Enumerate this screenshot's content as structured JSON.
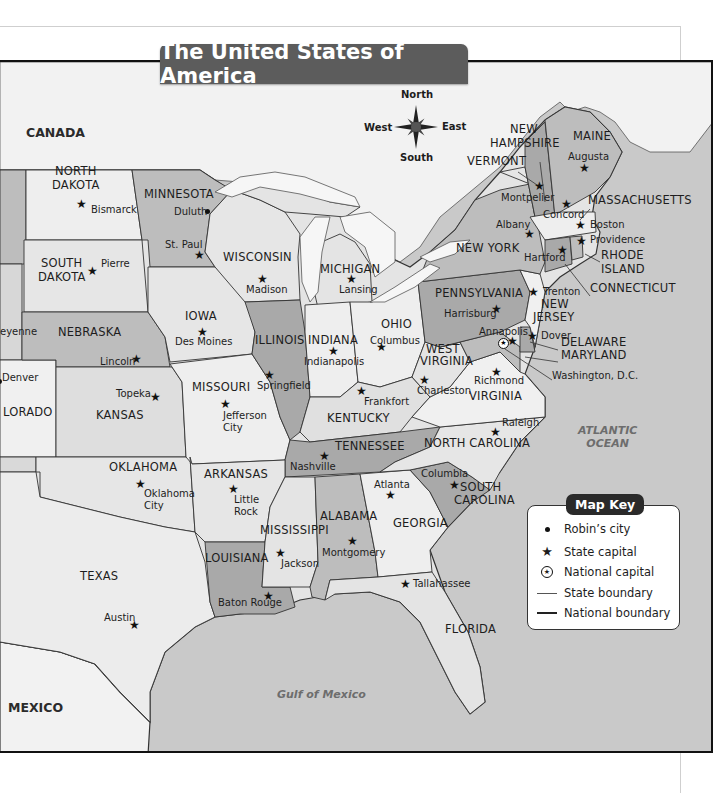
{
  "title": "The United States of America",
  "compass": {
    "north": "North",
    "south": "South",
    "east": "East",
    "west": "West"
  },
  "countries": [
    {
      "name": "CANADA",
      "x": 26,
      "y": 125
    },
    {
      "name": "MEXICO",
      "x": 8,
      "y": 700
    }
  ],
  "oceans": [
    {
      "name": "ATLANTIC\nOCEAN",
      "line1": "ATLANTIC",
      "line2": "OCEAN",
      "x": 578,
      "y": 423
    },
    {
      "name": "Gulf of Mexico",
      "line1": "Gulf of Mexico",
      "line2": "",
      "x": 277,
      "y": 687
    }
  ],
  "states": [
    {
      "name": "NORTH",
      "x": 55,
      "y": 172
    },
    {
      "name": "DAKOTA",
      "x": 52,
      "y": 186
    },
    {
      "name": "MINNESOTA",
      "x": 144,
      "y": 195
    },
    {
      "name": "SOUTH",
      "x": 41,
      "y": 264
    },
    {
      "name": "DAKOTA",
      "x": 38,
      "y": 278
    },
    {
      "name": "WISCONSIN",
      "x": 223,
      "y": 258
    },
    {
      "name": "MICHIGAN",
      "x": 320,
      "y": 270
    },
    {
      "name": "NEW YORK",
      "x": 456,
      "y": 249
    },
    {
      "name": "NEBRASKA",
      "x": 58,
      "y": 333
    },
    {
      "name": "IOWA",
      "x": 185,
      "y": 317
    },
    {
      "name": "ILLINOIS",
      "x": 255,
      "y": 341
    },
    {
      "name": "INDIANA",
      "x": 308,
      "y": 341
    },
    {
      "name": "OHIO",
      "x": 381,
      "y": 325
    },
    {
      "name": "PENNSYLVANIA",
      "x": 435,
      "y": 294
    },
    {
      "name": "NEW",
      "x": 541,
      "y": 305
    },
    {
      "name": "JERSEY",
      "x": 533,
      "y": 318
    },
    {
      "name": "WEST",
      "x": 426,
      "y": 350
    },
    {
      "name": "VIRGINIA",
      "x": 420,
      "y": 362
    },
    {
      "name": "VIRGINIA",
      "x": 469,
      "y": 397
    },
    {
      "name": "COLORADO",
      "display": "LORADO",
      "x": 3,
      "y": 413
    },
    {
      "name": "KANSAS",
      "x": 96,
      "y": 416
    },
    {
      "name": "MISSOURI",
      "x": 192,
      "y": 388
    },
    {
      "name": "KENTUCKY",
      "x": 327,
      "y": 419
    },
    {
      "name": "TENNESSEE",
      "x": 335,
      "y": 447
    },
    {
      "name": "NORTH CAROLINA",
      "x": 424,
      "y": 444
    },
    {
      "name": "OKLAHOMA",
      "x": 109,
      "y": 468
    },
    {
      "name": "ARKANSAS",
      "x": 204,
      "y": 475
    },
    {
      "name": "SOUTH",
      "x": 460,
      "y": 488
    },
    {
      "name": "CAROLINA",
      "x": 454,
      "y": 501
    },
    {
      "name": "GEORGIA",
      "x": 393,
      "y": 524
    },
    {
      "name": "ALABAMA",
      "x": 320,
      "y": 517
    },
    {
      "name": "MISSISSIPPI",
      "x": 260,
      "y": 531
    },
    {
      "name": "LOUISIANA",
      "x": 205,
      "y": 559
    },
    {
      "name": "TEXAS",
      "x": 80,
      "y": 577
    },
    {
      "name": "FLORIDA",
      "x": 445,
      "y": 630
    },
    {
      "name": "MAINE",
      "x": 573,
      "y": 137
    },
    {
      "name": "NEW",
      "x": 510,
      "y": 130
    },
    {
      "name": "HAMPSHIRE",
      "x": 490,
      "y": 144
    },
    {
      "name": "VERMONT",
      "x": 467,
      "y": 162
    },
    {
      "name": "MASSACHUSETTS",
      "x": 588,
      "y": 201
    },
    {
      "name": "RHODE",
      "x": 601,
      "y": 256
    },
    {
      "name": "ISLAND",
      "x": 601,
      "y": 270
    },
    {
      "name": "CONNECTICUT",
      "x": 590,
      "y": 289
    },
    {
      "name": "DELAWARE",
      "x": 561,
      "y": 343
    },
    {
      "name": "MARYLAND",
      "x": 561,
      "y": 356
    }
  ],
  "cities": [
    {
      "name": "Bismarck",
      "x": 91,
      "y": 210,
      "symbol": "star",
      "sx": 81,
      "sy": 204
    },
    {
      "name": "Duluth",
      "x": 174,
      "y": 212,
      "symbol": "dot",
      "sx": 207,
      "sy": 211
    },
    {
      "name": "St. Paul",
      "x": 165,
      "y": 245,
      "symbol": "star",
      "sx": 199,
      "sy": 255
    },
    {
      "name": "Pierre",
      "x": 101,
      "y": 264,
      "symbol": "star",
      "sx": 92,
      "sy": 271
    },
    {
      "name": "Madison",
      "x": 246,
      "y": 290,
      "symbol": "star",
      "sx": 262,
      "sy": 279
    },
    {
      "name": "Lansing",
      "x": 339,
      "y": 290,
      "symbol": "star",
      "sx": 351,
      "sy": 279
    },
    {
      "name": "Des Moines",
      "x": 175,
      "y": 342,
      "symbol": "star",
      "sx": 202,
      "sy": 332
    },
    {
      "name": "Lincoln",
      "x": 100,
      "y": 362,
      "symbol": "star",
      "sx": 136,
      "sy": 359
    },
    {
      "name": "Indianapolis",
      "x": 304,
      "y": 362,
      "symbol": "star",
      "sx": 333,
      "sy": 351
    },
    {
      "name": "Columbus",
      "x": 370,
      "y": 341,
      "symbol": "star",
      "sx": 381,
      "sy": 347
    },
    {
      "name": "Harrisburg",
      "x": 444,
      "y": 314,
      "symbol": "star",
      "sx": 496,
      "sy": 309
    },
    {
      "name": "Trenton",
      "x": 543,
      "y": 292,
      "symbol": "star",
      "sx": 533,
      "sy": 292
    },
    {
      "name": "Annapolis",
      "x": 479,
      "y": 332,
      "symbol": "star",
      "sx": 512,
      "sy": 341
    },
    {
      "name": "Dover",
      "x": 541,
      "y": 336,
      "symbol": "star",
      "sx": 532,
      "sy": 336
    },
    {
      "name": "Washington, D.C.",
      "x": 552,
      "y": 376,
      "symbol": "national-capital",
      "sx": 504,
      "sy": 344
    },
    {
      "name": "Charleston",
      "x": 417,
      "y": 391,
      "symbol": "star",
      "sx": 424,
      "sy": 380
    },
    {
      "name": "Richmond",
      "x": 474,
      "y": 381,
      "symbol": "star",
      "sx": 496,
      "sy": 372
    },
    {
      "name": "Denver",
      "x": 2,
      "y": 378,
      "symbol": "dot",
      "sx": -1,
      "sy": 381
    },
    {
      "name": "Topeka",
      "x": 116,
      "y": 394,
      "symbol": "star",
      "sx": 155,
      "sy": 397
    },
    {
      "name": "Jefferson",
      "x": 223,
      "y": 416,
      "symbol": "star",
      "sx": 225,
      "sy": 404
    },
    {
      "name": "City",
      "x": 223,
      "y": 428,
      "symbol": "none"
    },
    {
      "name": "Springfield",
      "x": 257,
      "y": 386,
      "symbol": "star",
      "sx": 269,
      "sy": 375
    },
    {
      "name": "Frankfort",
      "x": 364,
      "y": 402,
      "symbol": "star",
      "sx": 361,
      "sy": 391
    },
    {
      "name": "Nashville",
      "x": 290,
      "y": 467,
      "symbol": "star",
      "sx": 324,
      "sy": 456
    },
    {
      "name": "Raleigh",
      "x": 502,
      "y": 423,
      "symbol": "star",
      "sx": 495,
      "sy": 432
    },
    {
      "name": "Columbia",
      "x": 421,
      "y": 474,
      "symbol": "star",
      "sx": 454,
      "sy": 485
    },
    {
      "name": "Atlanta",
      "x": 374,
      "y": 485,
      "symbol": "star",
      "sx": 390,
      "sy": 495
    },
    {
      "name": "Oklahoma",
      "x": 144,
      "y": 494,
      "symbol": "star",
      "sx": 140,
      "sy": 484
    },
    {
      "name": "City",
      "x": 144,
      "y": 506,
      "symbol": "none"
    },
    {
      "name": "Little",
      "x": 234,
      "y": 500,
      "symbol": "star",
      "sx": 233,
      "sy": 489
    },
    {
      "name": "Rock",
      "x": 234,
      "y": 512,
      "symbol": "none"
    },
    {
      "name": "Montgomery",
      "x": 322,
      "y": 553,
      "symbol": "star",
      "sx": 352,
      "sy": 541
    },
    {
      "name": "Jackson",
      "x": 281,
      "y": 564,
      "symbol": "star",
      "sx": 280,
      "sy": 553
    },
    {
      "name": "Baton Rouge",
      "x": 218,
      "y": 603,
      "symbol": "star",
      "sx": 268,
      "sy": 596
    },
    {
      "name": "Tallahassee",
      "x": 413,
      "y": 584,
      "symbol": "star",
      "sx": 405,
      "sy": 584
    },
    {
      "name": "Austin",
      "x": 104,
      "y": 618,
      "symbol": "star",
      "sx": 134,
      "sy": 625
    },
    {
      "name": "Augusta",
      "x": 568,
      "y": 157,
      "symbol": "star",
      "sx": 584,
      "sy": 168
    },
    {
      "name": "Montpelier",
      "x": 501,
      "y": 198,
      "symbol": "star",
      "sx": 539,
      "sy": 186
    },
    {
      "name": "Concord",
      "x": 543,
      "y": 215,
      "symbol": "star",
      "sx": 566,
      "sy": 204
    },
    {
      "name": "Albany",
      "x": 496,
      "y": 225,
      "symbol": "star",
      "sx": 529,
      "sy": 234
    },
    {
      "name": "Boston",
      "x": 590,
      "y": 225,
      "symbol": "star",
      "sx": 580,
      "sy": 225
    },
    {
      "name": "Providence",
      "x": 590,
      "y": 240,
      "symbol": "star",
      "sx": 581,
      "sy": 241
    },
    {
      "name": "Hartford",
      "x": 524,
      "y": 258,
      "symbol": "star",
      "sx": 562,
      "sy": 250
    },
    {
      "name": "Cheyenne",
      "display": "eyenne",
      "x": 0,
      "y": 332,
      "symbol": "none"
    }
  ],
  "map_key": {
    "title": "Map Key",
    "items": [
      {
        "symbol": "dot",
        "label": "Robin’s city"
      },
      {
        "symbol": "star",
        "label": "State capital"
      },
      {
        "symbol": "national-capital",
        "label": "National capital"
      },
      {
        "symbol": "thin-line",
        "label": "State boundary"
      },
      {
        "symbol": "thick-line",
        "label": "National boundary"
      }
    ]
  },
  "colors": {
    "land_light": "#ececec",
    "land_mid": "#d6d6d6",
    "land_dark": "#a9a9a9",
    "water": "#c8c8c8",
    "lakes": "#f4f4f4",
    "title_bg": "#5c5c5c"
  }
}
